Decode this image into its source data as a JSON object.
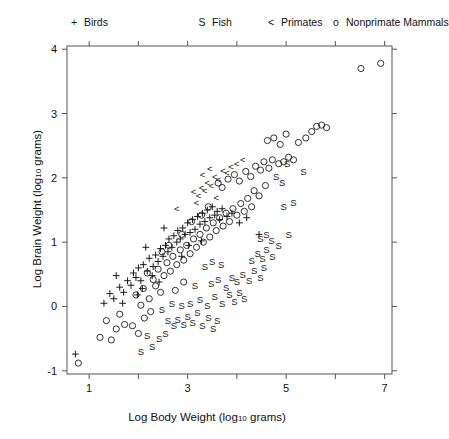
{
  "legend": {
    "position": "top",
    "items": [
      {
        "symbol": "+",
        "label": "Birds",
        "key": "birds"
      },
      {
        "symbol": "S",
        "label": "Fish",
        "key": "fish"
      },
      {
        "symbol": "<",
        "label": "Primates",
        "key": "primates"
      },
      {
        "symbol": "o",
        "label": "Nonprimate Mammals",
        "key": "mammals"
      }
    ]
  },
  "axes": {
    "x_title_main": "Log Body Weight (log",
    "x_title_sub": "10",
    "x_title_tail": " grams)",
    "y_title_main": "Log Brain Weight (log",
    "y_title_sub": "10",
    "y_title_tail": " grams)",
    "x_ticks": [
      "1",
      "3",
      "5",
      "7"
    ],
    "y_ticks": [
      "4",
      "3",
      "2",
      "1",
      "0",
      "-1"
    ]
  },
  "chart_data": {
    "type": "scatter",
    "title": "",
    "xlabel": "Log Body Weight (log10 grams)",
    "ylabel": "Log Brain Weight (log10 grams)",
    "xlim": [
      0.55,
      7.15
    ],
    "ylim": [
      -1.05,
      4.05
    ],
    "xticks": [
      1,
      2,
      3,
      4,
      5,
      6,
      7
    ],
    "xticklabels": [
      "1",
      "",
      "3",
      "",
      "5",
      "",
      "7"
    ],
    "yticks": [
      -1,
      0,
      1,
      2,
      3,
      4
    ],
    "yticklabels": [
      "-1",
      "0",
      "1",
      "2",
      "3",
      "4"
    ],
    "grid": false,
    "legend_position": "above-axes",
    "series": [
      {
        "name": "Birds",
        "symbol": "+",
        "color": "#1a1a1a",
        "points": [
          [
            0.72,
            -0.74
          ],
          [
            1.3,
            0.05
          ],
          [
            1.42,
            0.2
          ],
          [
            1.5,
            0.12
          ],
          [
            1.62,
            0.3
          ],
          [
            1.7,
            0.22
          ],
          [
            1.78,
            0.4
          ],
          [
            1.85,
            0.33
          ],
          [
            1.9,
            0.52
          ],
          [
            1.95,
            0.45
          ],
          [
            2.0,
            0.6
          ],
          [
            2.05,
            0.4
          ],
          [
            2.1,
            0.65
          ],
          [
            2.18,
            0.55
          ],
          [
            2.22,
            0.75
          ],
          [
            2.3,
            0.62
          ],
          [
            2.35,
            0.8
          ],
          [
            2.4,
            0.7
          ],
          [
            2.45,
            0.9
          ],
          [
            2.5,
            0.78
          ],
          [
            2.55,
            0.95
          ],
          [
            2.6,
            0.85
          ],
          [
            2.62,
            1.05
          ],
          [
            2.68,
            0.92
          ],
          [
            2.72,
            1.1
          ],
          [
            2.78,
            1.0
          ],
          [
            2.8,
            1.18
          ],
          [
            2.85,
            1.05
          ],
          [
            2.9,
            1.22
          ],
          [
            2.95,
            1.12
          ],
          [
            3.0,
            1.3
          ],
          [
            3.05,
            1.15
          ],
          [
            3.1,
            1.35
          ],
          [
            3.15,
            1.2
          ],
          [
            3.2,
            1.4
          ],
          [
            3.25,
            1.28
          ],
          [
            3.3,
            1.45
          ],
          [
            3.35,
            1.32
          ],
          [
            3.4,
            1.5
          ],
          [
            3.45,
            1.38
          ],
          [
            3.5,
            1.55
          ],
          [
            3.55,
            1.42
          ],
          [
            3.6,
            1.48
          ],
          [
            3.65,
            1.35
          ],
          [
            3.7,
            1.52
          ],
          [
            3.8,
            1.4
          ],
          [
            3.9,
            1.45
          ],
          [
            4.05,
            1.3
          ],
          [
            4.2,
            1.38
          ],
          [
            2.08,
            0.28
          ],
          [
            2.28,
            0.48
          ],
          [
            1.55,
            0.48
          ],
          [
            1.68,
            0.05
          ],
          [
            2.42,
            0.38
          ],
          [
            3.02,
            0.95
          ],
          [
            3.28,
            1.02
          ],
          [
            2.52,
            1.22
          ],
          [
            2.88,
            0.78
          ],
          [
            2.15,
            0.92
          ],
          [
            1.98,
            0.18
          ],
          [
            4.45,
            1.12
          ]
        ]
      },
      {
        "name": "Fish",
        "symbol": "S",
        "color": "#1a1a1a",
        "points": [
          [
            2.05,
            -0.7
          ],
          [
            2.28,
            -0.62
          ],
          [
            2.42,
            -0.5
          ],
          [
            2.18,
            -0.45
          ],
          [
            2.55,
            -0.42
          ],
          [
            2.72,
            -0.3
          ],
          [
            2.6,
            -0.22
          ],
          [
            2.8,
            -0.2
          ],
          [
            2.92,
            -0.28
          ],
          [
            3.0,
            -0.15
          ],
          [
            3.1,
            -0.25
          ],
          [
            3.2,
            -0.1
          ],
          [
            3.3,
            -0.3
          ],
          [
            3.42,
            -0.18
          ],
          [
            3.52,
            -0.35
          ],
          [
            3.6,
            -0.22
          ],
          [
            3.05,
            0.05
          ],
          [
            3.25,
            0.1
          ],
          [
            3.4,
            0.02
          ],
          [
            3.55,
            0.15
          ],
          [
            3.7,
            0.05
          ],
          [
            3.85,
            0.18
          ],
          [
            3.95,
            0.08
          ],
          [
            4.05,
            0.22
          ],
          [
            4.15,
            0.12
          ],
          [
            3.48,
            0.35
          ],
          [
            3.62,
            0.42
          ],
          [
            3.78,
            0.3
          ],
          [
            3.9,
            0.45
          ],
          [
            4.0,
            0.38
          ],
          [
            4.12,
            0.5
          ],
          [
            4.25,
            0.4
          ],
          [
            4.35,
            0.55
          ],
          [
            4.48,
            0.45
          ],
          [
            4.55,
            0.6
          ],
          [
            4.3,
            0.72
          ],
          [
            4.42,
            0.82
          ],
          [
            4.52,
            0.75
          ],
          [
            4.6,
            0.88
          ],
          [
            4.72,
            0.78
          ],
          [
            4.48,
            1.05
          ],
          [
            4.6,
            1.12
          ],
          [
            4.7,
            1.02
          ],
          [
            4.85,
            0.95
          ],
          [
            5.05,
            1.12
          ],
          [
            4.95,
            1.55
          ],
          [
            5.15,
            1.62
          ],
          [
            3.35,
            0.62
          ],
          [
            3.5,
            0.7
          ],
          [
            3.68,
            0.65
          ],
          [
            2.88,
            0.02
          ],
          [
            3.15,
            0.32
          ],
          [
            4.8,
            2.02
          ],
          [
            4.92,
            1.92
          ],
          [
            5.35,
            2.1
          ],
          [
            5.02,
            2.22
          ],
          [
            2.48,
            -0.05
          ],
          [
            2.68,
            0.05
          ]
        ]
      },
      {
        "name": "Primates",
        "symbol": "<",
        "color": "#1a1a1a",
        "points": [
          [
            2.78,
            1.52
          ],
          [
            3.12,
            1.78
          ],
          [
            3.22,
            1.72
          ],
          [
            3.28,
            1.85
          ],
          [
            3.35,
            1.8
          ],
          [
            3.4,
            1.92
          ],
          [
            3.48,
            1.88
          ],
          [
            3.55,
            2.02
          ],
          [
            3.62,
            1.98
          ],
          [
            3.72,
            2.12
          ],
          [
            3.8,
            2.08
          ],
          [
            3.88,
            2.18
          ],
          [
            4.0,
            2.22
          ],
          [
            4.12,
            2.28
          ],
          [
            3.3,
            2.05
          ],
          [
            3.45,
            2.15
          ],
          [
            3.18,
            1.62
          ],
          [
            3.58,
            1.7
          ]
        ]
      },
      {
        "name": "Nonprimate Mammals",
        "symbol": "o",
        "color": "#1a1a1a",
        "points": [
          [
            0.78,
            -0.88
          ],
          [
            1.22,
            -0.48
          ],
          [
            1.55,
            -0.35
          ],
          [
            1.72,
            -0.28
          ],
          [
            1.88,
            -0.3
          ],
          [
            2.0,
            -0.42
          ],
          [
            1.45,
            -0.52
          ],
          [
            2.12,
            -0.18
          ],
          [
            2.25,
            -0.08
          ],
          [
            1.95,
            0.18
          ],
          [
            2.1,
            0.28
          ],
          [
            2.22,
            0.12
          ],
          [
            2.35,
            0.32
          ],
          [
            2.45,
            0.22
          ],
          [
            2.18,
            0.52
          ],
          [
            2.3,
            0.42
          ],
          [
            2.4,
            0.58
          ],
          [
            2.52,
            0.48
          ],
          [
            2.58,
            0.68
          ],
          [
            2.65,
            0.55
          ],
          [
            2.7,
            0.78
          ],
          [
            2.78,
            0.65
          ],
          [
            2.85,
            0.88
          ],
          [
            2.92,
            0.72
          ],
          [
            2.98,
            0.95
          ],
          [
            3.05,
            0.82
          ],
          [
            3.12,
            1.05
          ],
          [
            3.18,
            0.92
          ],
          [
            3.25,
            1.12
          ],
          [
            3.32,
            1.0
          ],
          [
            3.38,
            1.22
          ],
          [
            3.45,
            1.08
          ],
          [
            3.52,
            1.3
          ],
          [
            3.58,
            1.18
          ],
          [
            3.65,
            1.38
          ],
          [
            3.72,
            1.25
          ],
          [
            3.78,
            1.45
          ],
          [
            3.85,
            1.32
          ],
          [
            3.92,
            1.52
          ],
          [
            4.0,
            1.42
          ],
          [
            4.08,
            1.6
          ],
          [
            4.15,
            1.48
          ],
          [
            4.22,
            1.68
          ],
          [
            4.3,
            1.55
          ],
          [
            3.62,
            1.92
          ],
          [
            3.7,
            1.85
          ],
          [
            3.82,
            1.98
          ],
          [
            3.95,
            2.05
          ],
          [
            4.05,
            1.95
          ],
          [
            4.18,
            2.1
          ],
          [
            4.28,
            2.02
          ],
          [
            4.38,
            2.18
          ],
          [
            4.48,
            2.12
          ],
          [
            4.55,
            2.25
          ],
          [
            4.65,
            2.15
          ],
          [
            4.72,
            2.28
          ],
          [
            4.85,
            2.22
          ],
          [
            4.95,
            2.25
          ],
          [
            5.05,
            2.32
          ],
          [
            5.15,
            2.28
          ],
          [
            5.25,
            2.55
          ],
          [
            5.4,
            2.62
          ],
          [
            5.52,
            2.72
          ],
          [
            5.62,
            2.8
          ],
          [
            5.72,
            2.82
          ],
          [
            5.82,
            2.78
          ],
          [
            6.52,
            3.7
          ],
          [
            6.92,
            3.78
          ],
          [
            4.62,
            2.58
          ],
          [
            4.75,
            2.62
          ],
          [
            4.88,
            2.52
          ],
          [
            5.0,
            2.68
          ],
          [
            2.05,
            0.02
          ],
          [
            2.62,
            0.95
          ],
          [
            2.88,
            1.12
          ],
          [
            3.08,
            1.32
          ],
          [
            1.35,
            -0.22
          ],
          [
            1.62,
            -0.12
          ],
          [
            2.48,
            0.85
          ],
          [
            3.42,
            1.55
          ],
          [
            4.35,
            1.8
          ],
          [
            4.45,
            1.72
          ],
          [
            4.58,
            1.88
          ],
          [
            3.28,
            1.42
          ],
          [
            2.92,
            0.38
          ],
          [
            2.75,
            0.25
          ]
        ]
      }
    ]
  }
}
